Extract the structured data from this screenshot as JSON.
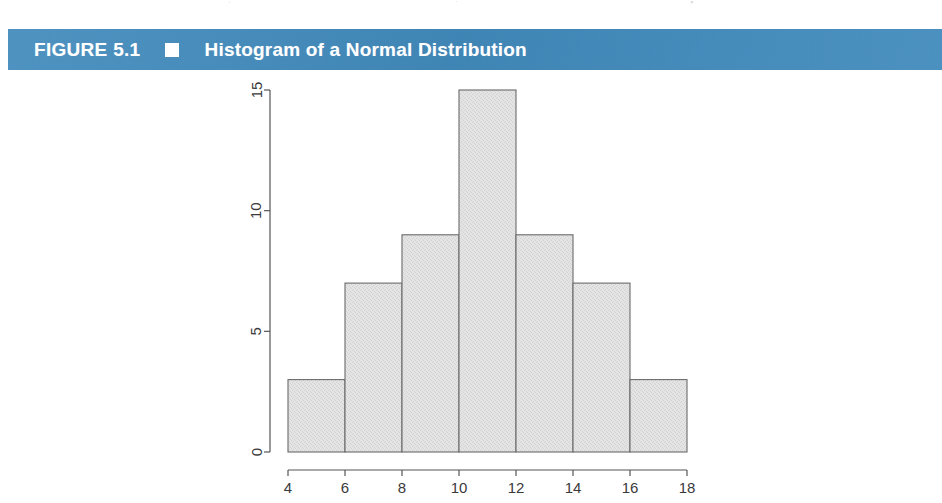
{
  "figure": {
    "number_label": "FIGURE 5.1",
    "bullet_icon": "filled-square-icon",
    "title": "Histogram of a Normal Distribution",
    "bar_color": "#3f8cc0",
    "text_color": "#ffffff"
  },
  "scan_artifacts": {
    "a": "·",
    "b": "·",
    "c": "▪"
  },
  "chart_data": {
    "type": "bar",
    "title": "Histogram of a Normal Distribution",
    "xlabel": "",
    "ylabel": "",
    "bin_edges": [
      4,
      6,
      8,
      10,
      12,
      14,
      16,
      18
    ],
    "categories": [
      "4-6",
      "6-8",
      "8-10",
      "10-12",
      "12-14",
      "14-16",
      "16-18"
    ],
    "values": [
      3,
      7,
      9,
      15,
      9,
      7,
      3
    ],
    "xlim": [
      4,
      18
    ],
    "ylim": [
      0,
      15
    ],
    "xticks": [
      4,
      6,
      8,
      10,
      12,
      14,
      16,
      18
    ],
    "xtick_labels": [
      "4",
      "6",
      "8",
      "10",
      "12",
      "14",
      "16",
      "18"
    ],
    "yticks": [
      0,
      5,
      10,
      15
    ],
    "ytick_labels": [
      "0",
      "5",
      "10",
      "15"
    ],
    "grid": false,
    "legend": false,
    "bar_fill": "#e4e4e4",
    "bar_border": "#6a6a6a"
  }
}
